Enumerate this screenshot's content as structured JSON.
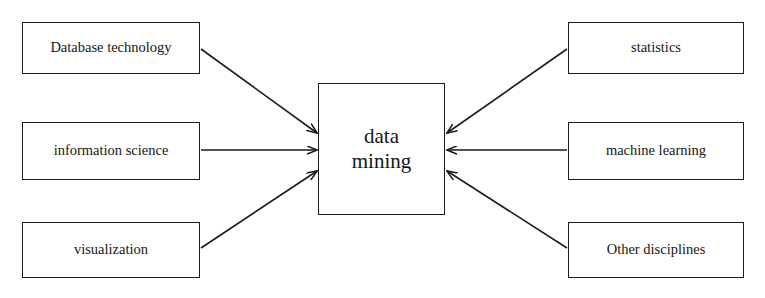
{
  "diagram": {
    "type": "convergence-diagram",
    "background_color": "#ffffff",
    "stroke_color": "#1a1a1a",
    "text_color": "#161616",
    "canvas": {
      "width": 765,
      "height": 298
    }
  },
  "center": {
    "id": "data-mining",
    "line1": "data",
    "line2": "mining",
    "full_label": "data mining",
    "box": {
      "x": 318,
      "y": 83,
      "width": 127,
      "height": 132
    }
  },
  "left_nodes": [
    {
      "id": "database-technology",
      "label": "Database technology",
      "box": {
        "x": 22,
        "y": 22,
        "width": 178,
        "height": 52
      }
    },
    {
      "id": "information-science",
      "label": "information science",
      "box": {
        "x": 22,
        "y": 122,
        "width": 178,
        "height": 58
      }
    },
    {
      "id": "visualization",
      "label": "visualization",
      "box": {
        "x": 22,
        "y": 222,
        "width": 178,
        "height": 56
      }
    }
  ],
  "right_nodes": [
    {
      "id": "statistics",
      "label": "statistics",
      "box": {
        "x": 568,
        "y": 22,
        "width": 176,
        "height": 52
      }
    },
    {
      "id": "machine-learning",
      "label": "machine learning",
      "box": {
        "x": 568,
        "y": 122,
        "width": 176,
        "height": 58
      }
    },
    {
      "id": "other-disciplines",
      "label": "Other disciplines",
      "box": {
        "x": 568,
        "y": 222,
        "width": 176,
        "height": 56
      }
    }
  ],
  "edges": [
    {
      "id": "edge-database-technology",
      "from": "database-technology",
      "to": "data-mining",
      "x1": 201,
      "y1": 49,
      "x2": 317,
      "y2": 133,
      "arrowhead": "target"
    },
    {
      "id": "edge-information-science",
      "from": "information-science",
      "to": "data-mining",
      "x1": 201,
      "y1": 150,
      "x2": 317,
      "y2": 150,
      "arrowhead": "target"
    },
    {
      "id": "edge-visualization",
      "from": "visualization",
      "to": "data-mining",
      "x1": 201,
      "y1": 248,
      "x2": 317,
      "y2": 171,
      "arrowhead": "target"
    },
    {
      "id": "edge-statistics",
      "from": "statistics",
      "to": "data-mining",
      "x1": 567,
      "y1": 49,
      "x2": 447,
      "y2": 133,
      "arrowhead": "target"
    },
    {
      "id": "edge-machine-learning",
      "from": "machine-learning",
      "to": "data-mining",
      "x1": 567,
      "y1": 150,
      "x2": 447,
      "y2": 150,
      "arrowhead": "target"
    },
    {
      "id": "edge-other-disciplines",
      "from": "other-disciplines",
      "to": "data-mining",
      "x1": 567,
      "y1": 248,
      "x2": 447,
      "y2": 171,
      "arrowhead": "target"
    }
  ]
}
